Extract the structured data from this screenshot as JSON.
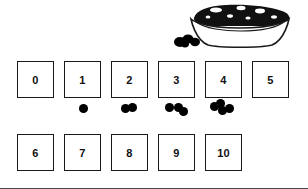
{
  "worksheet": {
    "title": "Number boxes 0 to 10 with bean counters",
    "bowl": {
      "icon": "bowl-of-beans",
      "description": "Bowl filled with black beans",
      "loose_beans_icon": "loose-beans",
      "loose_beans_count": 3
    },
    "rows": [
      {
        "name": "row-top",
        "boxes": [
          {
            "label": "0",
            "counters": 0,
            "left": 17,
            "top": 61
          },
          {
            "label": "1",
            "counters": 1,
            "left": 64,
            "top": 61
          },
          {
            "label": "2",
            "counters": 2,
            "left": 111,
            "top": 61
          },
          {
            "label": "3",
            "counters": 3,
            "left": 158,
            "top": 61
          },
          {
            "label": "4",
            "counters": 4,
            "left": 205,
            "top": 61
          },
          {
            "label": "5",
            "counters": 0,
            "left": 252,
            "top": 61
          }
        ]
      },
      {
        "name": "row-bottom",
        "boxes": [
          {
            "label": "6",
            "counters": 0,
            "left": 17,
            "top": 134
          },
          {
            "label": "7",
            "counters": 0,
            "left": 64,
            "top": 134
          },
          {
            "label": "8",
            "counters": 0,
            "left": 111,
            "top": 134
          },
          {
            "label": "9",
            "counters": 0,
            "left": 158,
            "top": 134
          },
          {
            "label": "10",
            "counters": 0,
            "left": 205,
            "top": 134
          }
        ]
      }
    ],
    "counter_clusters": [
      {
        "for_box": "1",
        "count": 1,
        "left": 72,
        "top": 100,
        "beans": [
          {
            "x": 7,
            "y": 4
          }
        ]
      },
      {
        "for_box": "2",
        "count": 2,
        "left": 118,
        "top": 100,
        "beans": [
          {
            "x": 3,
            "y": 4
          },
          {
            "x": 10,
            "y": 3
          }
        ]
      },
      {
        "for_box": "3",
        "count": 3,
        "left": 163,
        "top": 100,
        "beans": [
          {
            "x": 2,
            "y": 3
          },
          {
            "x": 11,
            "y": 3
          },
          {
            "x": 16,
            "y": 7
          }
        ]
      },
      {
        "for_box": "4",
        "count": 4,
        "left": 208,
        "top": 98,
        "beans": [
          {
            "x": 2,
            "y": 4
          },
          {
            "x": 8,
            "y": 1
          },
          {
            "x": 10,
            "y": 8
          },
          {
            "x": 17,
            "y": 6
          }
        ]
      }
    ]
  },
  "colors": {
    "ink": "#1a1a1a",
    "bean": "#000000",
    "paper": "#ffffff"
  }
}
